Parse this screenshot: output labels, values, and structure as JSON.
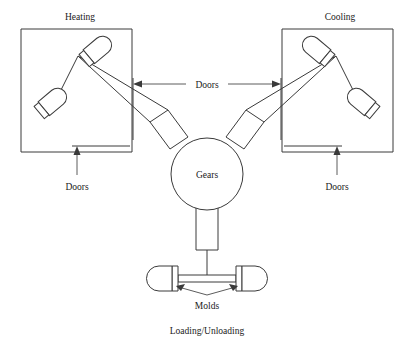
{
  "diagram": {
    "title_heating": "Heating",
    "title_cooling": "Cooling",
    "center_label": "Gears",
    "doors_top": "Doors",
    "doors_left": "Doors",
    "doors_right": "Doors",
    "molds_label": "Molds",
    "bottom_label": "Loading/Unloading",
    "colors": {
      "stroke": "#3a3a3a",
      "text": "#1a1a1a",
      "background": "#ffffff"
    },
    "icons": {
      "mold": "mold-capsule-icon",
      "arm": "gear-arm-icon",
      "arrow": "arrow-icon"
    }
  }
}
